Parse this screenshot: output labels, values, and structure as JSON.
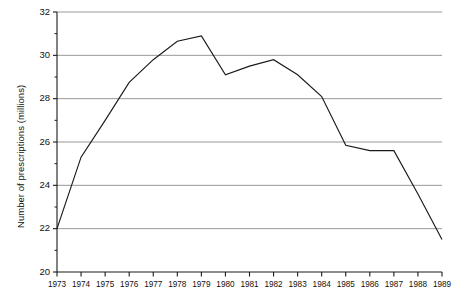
{
  "chart_data": {
    "type": "line",
    "title": "",
    "xlabel": "",
    "ylabel": "Number of prescriptions (millions)",
    "x": [
      1973,
      1974,
      1975,
      1976,
      1977,
      1978,
      1979,
      1980,
      1981,
      1982,
      1983,
      1984,
      1985,
      1986,
      1987,
      1988,
      1989
    ],
    "categories": [
      "1973",
      "1974",
      "1975",
      "1976",
      "1977",
      "1978",
      "1979",
      "1980",
      "1981",
      "1982",
      "1983",
      "1984",
      "1985",
      "1986",
      "1987",
      "1988",
      "1989"
    ],
    "values": [
      22.0,
      25.3,
      27.0,
      28.75,
      29.8,
      30.65,
      30.9,
      29.1,
      29.5,
      29.8,
      29.1,
      28.1,
      25.85,
      25.6,
      25.6,
      23.6,
      21.5
    ],
    "series": [
      {
        "name": "Number of prescriptions",
        "values": [
          22.0,
          25.3,
          27.0,
          28.75,
          29.8,
          30.65,
          30.9,
          29.1,
          29.5,
          29.8,
          29.1,
          28.1,
          25.85,
          25.6,
          25.6,
          23.6,
          21.5
        ],
        "color": "#1a1a1a"
      }
    ],
    "ylim": [
      20,
      32
    ],
    "xlim": [
      1973,
      1989
    ],
    "y_major_ticks": [
      20,
      22,
      24,
      26,
      28,
      30,
      32
    ],
    "y_major_tick_labels": [
      "20",
      "22",
      "24",
      "26",
      "28",
      "30",
      "32"
    ],
    "y_minor_ticks": [
      21,
      23,
      25,
      27,
      29,
      31
    ],
    "x_ticks": [
      1973,
      1974,
      1975,
      1976,
      1977,
      1978,
      1979,
      1980,
      1981,
      1982,
      1983,
      1984,
      1985,
      1986,
      1987,
      1988,
      1989
    ],
    "x_tick_labels": [
      "1973",
      "1974",
      "1975",
      "1976",
      "1977",
      "1978",
      "1979",
      "1980",
      "1981",
      "1982",
      "1983",
      "1984",
      "1985",
      "1986",
      "1987",
      "1988",
      "1989"
    ],
    "grid": {
      "horizontal": true,
      "vertical": false,
      "color": "#8c8c8c"
    },
    "legend": {
      "visible": false,
      "position": "none",
      "entries": []
    },
    "annotations": [],
    "axis_color": "#1a1a1a",
    "background": "#ffffff"
  }
}
